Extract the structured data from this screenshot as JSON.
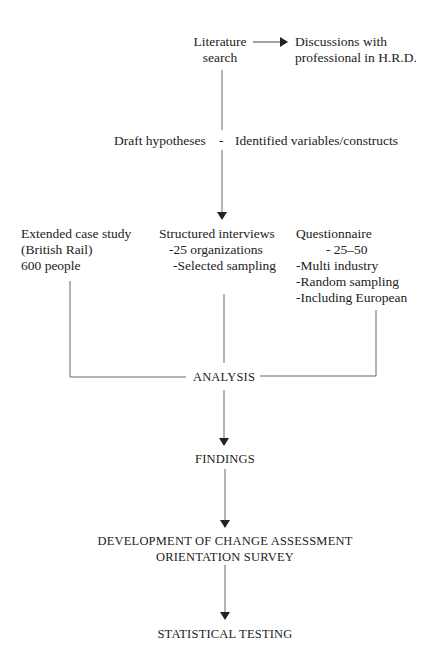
{
  "nodes": {
    "literature": {
      "line1": "Literature",
      "line2": "search"
    },
    "discussions": {
      "line1": "Discussions with",
      "line2": "professional in H.R.D."
    },
    "draft": "Draft hypotheses",
    "dash": "-",
    "identified": "Identified variables/constructs",
    "case_study": {
      "line1": "Extended case study",
      "line2": "(British Rail)",
      "line3": "600 people"
    },
    "interviews": {
      "line1": "Structured interviews",
      "line2": "-25 organizations",
      "line3": "-Selected sampling"
    },
    "questionnaire": {
      "line1": "Questionnaire",
      "line2": "-  25–50",
      "line3": "-Multi industry",
      "line4": "-Random sampling",
      "line5": "-Including European"
    },
    "analysis": "ANALYSIS",
    "findings": "FINDINGS",
    "development": {
      "line1": "DEVELOPMENT OF CHANGE ASSESSMENT",
      "line2": "ORIENTATION SURVEY"
    },
    "testing": "STATISTICAL TESTING"
  },
  "colors": {
    "line": "#555555",
    "text": "#222222"
  }
}
